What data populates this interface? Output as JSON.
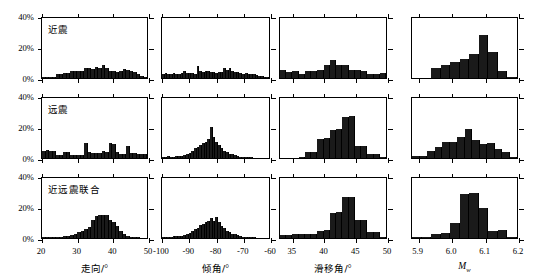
{
  "figure": {
    "yaxis": {
      "ticks": [
        "0%",
        "20%",
        "40%"
      ],
      "values": [
        0,
        20,
        40
      ],
      "max": 40
    },
    "rows": [
      {
        "key": "near",
        "label": "近震"
      },
      {
        "key": "tele",
        "label": "远震"
      },
      {
        "key": "joint",
        "label": "近远震联合"
      }
    ],
    "columns": [
      {
        "key": "strike",
        "axis_title": "走向/",
        "axis_unit": "°",
        "ticks": [
          "20",
          "30",
          "40",
          "50"
        ],
        "tickvals": [
          20,
          30,
          40,
          50
        ],
        "xlim": [
          20,
          50
        ]
      },
      {
        "key": "dip",
        "axis_title": "倾角/",
        "axis_unit": "°",
        "ticks": [
          "-100",
          "-90",
          "-80",
          "-70",
          "-60"
        ],
        "tickvals": [
          -100,
          -90,
          -80,
          -70,
          -60
        ],
        "xlim": [
          -100,
          -60
        ]
      },
      {
        "key": "rake",
        "axis_title": "滑移角/",
        "axis_unit": "°",
        "ticks": [
          "35",
          "40",
          "45",
          "50"
        ],
        "tickvals": [
          35,
          40,
          45,
          50
        ],
        "xlim": [
          33,
          50
        ]
      },
      {
        "key": "mw",
        "axis_title": "M",
        "axis_sub": "w",
        "axis_unit": "",
        "ticks": [
          "5.9",
          "6.0",
          "6.1",
          "6.2"
        ],
        "tickvals": [
          5.9,
          6.0,
          6.1,
          6.2
        ],
        "xlim": [
          5.88,
          6.2
        ]
      }
    ]
  },
  "chart_data": [
    {
      "type": "bar",
      "title": "近震 走向",
      "xlabel": "走向/°",
      "ylabel": "频数百分比",
      "ylim": [
        0,
        40
      ],
      "xlim": [
        20,
        50
      ],
      "grid": false,
      "categories": [
        "20-21",
        "21-22",
        "22-23",
        "23-24",
        "24-25",
        "25-26",
        "26-27",
        "27-28",
        "28-29",
        "29-30",
        "30-31",
        "31-32",
        "32-33",
        "33-34",
        "34-35",
        "35-36",
        "36-37",
        "37-38",
        "38-39",
        "39-40",
        "40-41",
        "41-42",
        "42-43",
        "43-44",
        "44-45",
        "45-46",
        "46-47",
        "47-48",
        "48-49",
        "49-50"
      ],
      "values": [
        0.4,
        0.6,
        0.8,
        1.0,
        2.8,
        3.0,
        3.1,
        3.2,
        4.6,
        4.8,
        5.0,
        4.6,
        7.0,
        6.8,
        6.2,
        7.2,
        6.6,
        8.5,
        7.0,
        4.8,
        4.4,
        4.0,
        4.6,
        6.2,
        5.2,
        4.8,
        4.2,
        3.0,
        1.4,
        0.9
      ]
    },
    {
      "type": "bar",
      "title": "近震 倾角",
      "xlabel": "倾角/°",
      "ylabel": "频数百分比",
      "ylim": [
        0,
        40
      ],
      "xlim": [
        -100,
        -60
      ],
      "grid": false,
      "categories": [
        "-100",
        "-99",
        "-98",
        "-97",
        "-96",
        "-95",
        "-94",
        "-93",
        "-92",
        "-91",
        "-90",
        "-89",
        "-88",
        "-87",
        "-86",
        "-85",
        "-84",
        "-83",
        "-82",
        "-81",
        "-80",
        "-79",
        "-78",
        "-77",
        "-76",
        "-75",
        "-74",
        "-73",
        "-72",
        "-71",
        "-70",
        "-69",
        "-68",
        "-67",
        "-66",
        "-65",
        "-64",
        "-63",
        "-62",
        "-61"
      ],
      "values": [
        3.0,
        3.2,
        2.6,
        2.4,
        3.4,
        3.0,
        2.8,
        3.6,
        5.0,
        3.4,
        3.2,
        3.2,
        3.0,
        8.0,
        4.8,
        4.0,
        5.0,
        4.4,
        4.0,
        3.8,
        3.6,
        3.8,
        4.0,
        6.4,
        5.6,
        6.6,
        4.4,
        4.0,
        3.8,
        3.2,
        2.6,
        3.2,
        3.0,
        2.8,
        2.4,
        2.0,
        1.6,
        1.4,
        1.0,
        0.6
      ]
    },
    {
      "type": "bar",
      "title": "近震 滑移角",
      "xlabel": "滑移角/°",
      "ylabel": "频数百分比",
      "ylim": [
        0,
        40
      ],
      "xlim": [
        33,
        50
      ],
      "grid": false,
      "categories": [
        "33-34",
        "34-35",
        "35-36",
        "36-37",
        "37-38",
        "38-39",
        "39-40",
        "40-41",
        "41-42",
        "42-43",
        "43-44",
        "44-45",
        "45-46",
        "46-47",
        "47-48",
        "48-49",
        "49-50"
      ],
      "values": [
        5.2,
        4.2,
        4.6,
        3.0,
        4.4,
        4.4,
        5.2,
        8.4,
        11.8,
        9.0,
        8.8,
        5.6,
        5.4,
        4.4,
        2.4,
        2.6,
        3.6
      ]
    },
    {
      "type": "bar",
      "title": "近震 Mw",
      "xlabel": "Mw",
      "ylabel": "频数百分比",
      "ylim": [
        0,
        40
      ],
      "xlim": [
        5.88,
        6.2
      ],
      "grid": false,
      "categories": [
        "5.97",
        "5.98",
        "5.99",
        "6.00",
        "6.01",
        "6.02",
        "6.03",
        "6.04",
        "6.05",
        "6.06",
        "6.07"
      ],
      "values": [
        0.0,
        0.0,
        7.0,
        9.0,
        11.0,
        12.5,
        16.0,
        28.5,
        17.5,
        4.5,
        0.6
      ]
    },
    {
      "type": "bar",
      "title": "远震 走向",
      "xlabel": "走向/°",
      "ylabel": "频数百分比",
      "ylim": [
        0,
        40
      ],
      "xlim": [
        20,
        50
      ],
      "grid": false,
      "categories": [
        "20-21",
        "21-22",
        "22-23",
        "23-24",
        "24-25",
        "25-26",
        "26-27",
        "27-28",
        "28-29",
        "29-30",
        "30-31",
        "31-32",
        "32-33",
        "33-34",
        "34-35",
        "35-36",
        "36-37",
        "37-38",
        "38-39",
        "39-40",
        "40-41",
        "41-42",
        "42-43",
        "43-44",
        "44-45",
        "45-46",
        "46-47",
        "47-48",
        "48-49",
        "49-50"
      ],
      "values": [
        5.0,
        5.2,
        4.6,
        4.4,
        2.0,
        2.0,
        3.8,
        4.0,
        2.2,
        2.0,
        2.2,
        2.0,
        10.2,
        4.0,
        3.6,
        3.6,
        3.4,
        4.4,
        4.0,
        9.8,
        9.2,
        4.0,
        2.4,
        3.0,
        8.0,
        3.6,
        3.2,
        3.0,
        2.8,
        2.4
      ]
    },
    {
      "type": "bar",
      "title": "远震 倾角",
      "xlabel": "倾角/°",
      "ylabel": "频数百分比",
      "ylim": [
        0,
        40
      ],
      "xlim": [
        -100,
        -60
      ],
      "grid": false,
      "categories": [
        "-100",
        "-99",
        "-98",
        "-97",
        "-96",
        "-95",
        "-94",
        "-93",
        "-92",
        "-91",
        "-90",
        "-89",
        "-88",
        "-87",
        "-86",
        "-85",
        "-84",
        "-83",
        "-82",
        "-81",
        "-80",
        "-79",
        "-78",
        "-77",
        "-76",
        "-75",
        "-74",
        "-73",
        "-72",
        "-71",
        "-70",
        "-69",
        "-68",
        "-67",
        "-66",
        "-65",
        "-64",
        "-63",
        "-62",
        "-61"
      ],
      "values": [
        0.8,
        1.0,
        1.2,
        0.8,
        1.0,
        1.2,
        1.4,
        1.6,
        2.2,
        3.0,
        3.6,
        5.0,
        6.6,
        7.6,
        9.0,
        10.0,
        11.0,
        12.4,
        20.6,
        14.0,
        11.0,
        9.0,
        7.0,
        5.0,
        4.0,
        3.0,
        2.4,
        1.8,
        1.4,
        1.0,
        0.8,
        0.6,
        0.5,
        0.4,
        0.3,
        0.3,
        0.2,
        0.2,
        0.1,
        0.1
      ]
    },
    {
      "type": "bar",
      "title": "远震 滑移角",
      "xlabel": "滑移角/°",
      "ylabel": "频数百分比",
      "ylim": [
        0,
        40
      ],
      "xlim": [
        33,
        50
      ],
      "grid": false,
      "categories": [
        "33-34",
        "34-35",
        "35-36",
        "36-37",
        "37-38",
        "38-39",
        "39-40",
        "40-41",
        "41-42",
        "42-43",
        "43-44",
        "44-45",
        "45-46",
        "46-47",
        "47-48",
        "48-49",
        "49-50"
      ],
      "values": [
        0.2,
        0.2,
        0.3,
        0.4,
        4.0,
        4.2,
        13.0,
        13.2,
        19.0,
        19.2,
        27.5,
        27.8,
        8.0,
        8.2,
        2.6,
        2.8,
        0.6
      ]
    },
    {
      "type": "bar",
      "title": "远震 Mw",
      "xlabel": "Mw",
      "ylabel": "频数百分比",
      "ylim": [
        0,
        40
      ],
      "xlim": [
        5.88,
        6.2
      ],
      "grid": false,
      "categories": [
        "5.97",
        "5.99",
        "6.00",
        "6.01",
        "6.02",
        "6.03",
        "6.04",
        "6.05",
        "6.06",
        "6.07",
        "6.08",
        "6.09",
        "6.10",
        "6.11"
      ],
      "values": [
        1.4,
        1.6,
        4.6,
        7.6,
        10.6,
        10.8,
        14.0,
        19.6,
        12.0,
        9.6,
        9.8,
        6.0,
        4.0,
        1.0
      ]
    },
    {
      "type": "bar",
      "title": "近远震联合 走向",
      "xlabel": "走向/°",
      "ylabel": "频数百分比",
      "ylim": [
        0,
        40
      ],
      "xlim": [
        20,
        50
      ],
      "grid": false,
      "categories": [
        "20-21",
        "21-22",
        "22-23",
        "23-24",
        "24-25",
        "25-26",
        "26-27",
        "27-28",
        "28-29",
        "29-30",
        "30-31",
        "31-32",
        "32-33",
        "33-34",
        "34-35",
        "35-36",
        "36-37",
        "37-38",
        "38-39",
        "39-40",
        "40-41",
        "41-42",
        "42-43",
        "43-44",
        "44-45",
        "45-46",
        "46-47",
        "47-48",
        "48-49",
        "49-50"
      ],
      "values": [
        0.4,
        0.4,
        0.5,
        0.6,
        0.8,
        1.0,
        1.2,
        1.6,
        2.0,
        3.0,
        4.0,
        5.0,
        6.2,
        7.4,
        12.0,
        15.0,
        15.2,
        15.4,
        15.6,
        12.0,
        11.0,
        8.0,
        4.4,
        3.0,
        1.6,
        1.0,
        0.6,
        0.4,
        0.3,
        0.2
      ]
    },
    {
      "type": "bar",
      "title": "近远震联合 倾角",
      "xlabel": "倾角/°",
      "ylabel": "频数百分比",
      "ylim": [
        0,
        40
      ],
      "xlim": [
        -100,
        -60
      ],
      "grid": false,
      "categories": [
        "-100",
        "-99",
        "-98",
        "-97",
        "-96",
        "-95",
        "-94",
        "-93",
        "-92",
        "-91",
        "-90",
        "-89",
        "-88",
        "-87",
        "-86",
        "-85",
        "-84",
        "-83",
        "-82",
        "-81",
        "-80",
        "-79",
        "-78",
        "-77",
        "-76",
        "-75",
        "-74",
        "-73",
        "-72",
        "-71",
        "-70",
        "-69",
        "-68",
        "-67",
        "-66",
        "-65",
        "-64",
        "-63",
        "-62",
        "-61"
      ],
      "values": [
        1.0,
        1.0,
        1.0,
        1.0,
        1.2,
        1.2,
        1.4,
        1.6,
        2.0,
        2.6,
        3.4,
        4.4,
        6.0,
        7.0,
        8.4,
        9.4,
        10.4,
        11.6,
        13.6,
        11.4,
        13.8,
        10.4,
        8.0,
        6.6,
        5.0,
        4.0,
        3.0,
        2.4,
        1.8,
        1.4,
        1.0,
        0.8,
        0.6,
        0.5,
        0.4,
        0.3,
        0.3,
        0.2,
        0.2,
        0.1
      ]
    },
    {
      "type": "bar",
      "title": "近远震联合 滑移角",
      "xlabel": "滑移角/°",
      "ylabel": "频数百分比",
      "ylim": [
        0,
        40
      ],
      "xlim": [
        33,
        50
      ],
      "grid": false,
      "categories": [
        "33-34",
        "34-35",
        "35-36",
        "36-37",
        "37-38",
        "38-39",
        "39-40",
        "40-41",
        "41-42",
        "42-43",
        "43-44",
        "44-45",
        "45-46",
        "46-47",
        "47-48",
        "48-49",
        "49-50"
      ],
      "values": [
        2.0,
        2.0,
        2.4,
        2.4,
        2.6,
        2.6,
        5.0,
        5.2,
        17.0,
        17.2,
        27.5,
        27.6,
        12.0,
        12.2,
        4.0,
        4.2,
        0.6
      ]
    },
    {
      "type": "bar",
      "title": "近远震联合 Mw",
      "xlabel": "Mw",
      "ylabel": "频数百分比",
      "ylim": [
        0,
        40
      ],
      "xlim": [
        5.88,
        6.2
      ],
      "grid": false,
      "categories": [
        "5.98",
        "5.99",
        "6.00",
        "6.01",
        "6.02",
        "6.03",
        "6.04",
        "6.05",
        "6.06",
        "6.07",
        "6.08"
      ],
      "values": [
        0.4,
        0.6,
        3.0,
        3.2,
        10.0,
        29.5,
        30.0,
        20.0,
        5.0,
        5.2,
        0.8
      ]
    }
  ]
}
